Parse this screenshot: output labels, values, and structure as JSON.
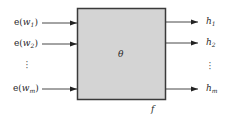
{
  "diagram": {
    "block": {
      "param_label": "θ",
      "function_label": "f",
      "fill": "#d4d4d4",
      "stroke": "#3a3a3a"
    },
    "inputs": [
      {
        "prefix": "e(",
        "var": "w",
        "sub": "1",
        "suffix": ")"
      },
      {
        "prefix": "e(",
        "var": "w",
        "sub": "2",
        "suffix": ")"
      },
      {
        "prefix": "e(",
        "var": "w",
        "sub": "m",
        "suffix": ")"
      }
    ],
    "outputs": [
      {
        "var": "h",
        "sub": "1"
      },
      {
        "var": "h",
        "sub": "2"
      },
      {
        "var": "h",
        "sub": "m"
      }
    ],
    "ellipsis": "⋮"
  }
}
